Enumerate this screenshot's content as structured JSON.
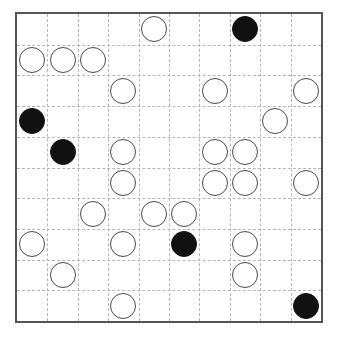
{
  "board": {
    "title": "Go board position diagram",
    "rows": 10,
    "columns": 10,
    "cell_size_px": 30.7,
    "border_color": "#555555",
    "grid_line_color": "#b6b6b6",
    "grid_line_style": "dashed",
    "background_color": "#ffffff",
    "black_stone_color": "#111111",
    "white_stone_color": "#ffffff",
    "white_stone_outline_color": "#4a4a4a",
    "stone_diameter_px": 26,
    "counts": {
      "black": 6,
      "white": 25,
      "total": 31,
      "empty": 69
    },
    "stones": [
      {
        "row": 0,
        "col": 4,
        "color": "white"
      },
      {
        "row": 0,
        "col": 7,
        "color": "black"
      },
      {
        "row": 1,
        "col": 0,
        "color": "white"
      },
      {
        "row": 1,
        "col": 1,
        "color": "white"
      },
      {
        "row": 1,
        "col": 2,
        "color": "white"
      },
      {
        "row": 2,
        "col": 3,
        "color": "white"
      },
      {
        "row": 2,
        "col": 6,
        "color": "white"
      },
      {
        "row": 2,
        "col": 9,
        "color": "white"
      },
      {
        "row": 3,
        "col": 0,
        "color": "black"
      },
      {
        "row": 3,
        "col": 8,
        "color": "white"
      },
      {
        "row": 4,
        "col": 1,
        "color": "black"
      },
      {
        "row": 4,
        "col": 3,
        "color": "white"
      },
      {
        "row": 4,
        "col": 6,
        "color": "white"
      },
      {
        "row": 4,
        "col": 7,
        "color": "white"
      },
      {
        "row": 5,
        "col": 3,
        "color": "white"
      },
      {
        "row": 5,
        "col": 6,
        "color": "white"
      },
      {
        "row": 5,
        "col": 7,
        "color": "white"
      },
      {
        "row": 5,
        "col": 9,
        "color": "white"
      },
      {
        "row": 6,
        "col": 2,
        "color": "white"
      },
      {
        "row": 6,
        "col": 4,
        "color": "white"
      },
      {
        "row": 6,
        "col": 5,
        "color": "white"
      },
      {
        "row": 7,
        "col": 0,
        "color": "white"
      },
      {
        "row": 7,
        "col": 3,
        "color": "white"
      },
      {
        "row": 7,
        "col": 5,
        "color": "black"
      },
      {
        "row": 7,
        "col": 7,
        "color": "white"
      },
      {
        "row": 8,
        "col": 1,
        "color": "white"
      },
      {
        "row": 8,
        "col": 7,
        "color": "white"
      },
      {
        "row": 9,
        "col": 3,
        "color": "white"
      },
      {
        "row": 9,
        "col": 9,
        "color": "black"
      }
    ]
  }
}
